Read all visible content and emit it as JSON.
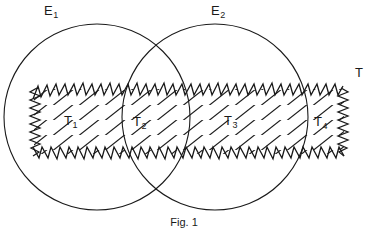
{
  "figure": {
    "caption": "Fig. 1",
    "stroke_color": "#1a1a1a",
    "background_color": "#ffffff",
    "width": 368,
    "height": 228
  },
  "sets": {
    "circle_left": {
      "label": "E",
      "subscript": "1",
      "cx": 97,
      "cy": 117,
      "r": 93
    },
    "circle_right": {
      "label": "E",
      "subscript": "2",
      "cx": 215,
      "cy": 117,
      "r": 93
    },
    "band": {
      "label": "T",
      "subscript": "",
      "x_left": 32,
      "x_right": 344,
      "y_top": 87,
      "y_bottom": 155
    }
  },
  "regions": [
    {
      "name": "region-t1",
      "label": "T",
      "subscript": "1"
    },
    {
      "name": "region-t2",
      "label": "T",
      "subscript": "2"
    },
    {
      "name": "region-t3",
      "label": "T",
      "subscript": "3"
    },
    {
      "name": "region-t4",
      "label": "T",
      "subscript": "4"
    }
  ]
}
